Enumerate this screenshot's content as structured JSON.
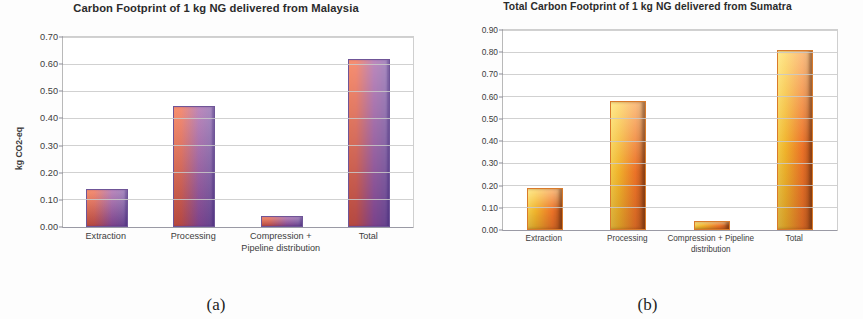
{
  "figure": {
    "panels": [
      {
        "caption": "(a)",
        "chart_data": {
          "type": "bar",
          "title": "Carbon Footprint of 1 kg NG delivered from Malaysia",
          "xlabel": "",
          "ylabel": "kg CO2-eq",
          "ylim": [
            0.0,
            0.7
          ],
          "ytick_step": 0.1,
          "yticks": [
            "0.00",
            "0.10",
            "0.20",
            "0.30",
            "0.40",
            "0.50",
            "0.60",
            "0.70"
          ],
          "grid": true,
          "legend": "none",
          "categories": [
            "Extraction",
            "Processing",
            "Compression + Pipeline distribution",
            "Total"
          ],
          "values": [
            0.14,
            0.445,
            0.04,
            0.62
          ],
          "bar_color": "#f4602f",
          "bar_color_end": "#7b5aa6"
        }
      },
      {
        "caption": "(b)",
        "chart_data": {
          "type": "bar",
          "title": "Total Carbon Footprint of 1 kg NG delivered from Sumatra",
          "xlabel": "",
          "ylabel": "kg CO2-eq",
          "ylim": [
            0.0,
            0.9
          ],
          "ytick_step": 0.1,
          "yticks": [
            "0.00",
            "0.10",
            "0.20",
            "0.30",
            "0.40",
            "0.50",
            "0.60",
            "0.70",
            "0.80",
            "0.90"
          ],
          "grid": true,
          "legend": "none",
          "categories": [
            "Extraction",
            "Processing",
            "Compression + Pipeline distribution",
            "Total"
          ],
          "values": [
            0.19,
            0.58,
            0.04,
            0.81
          ],
          "bar_color": "#ffd94a",
          "bar_color_end": "#b6561f"
        }
      }
    ]
  }
}
